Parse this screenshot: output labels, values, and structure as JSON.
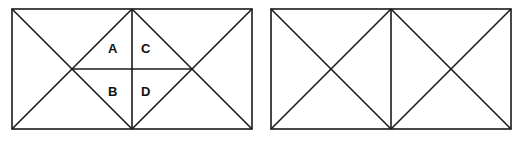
{
  "diagram": {
    "figures": [
      {
        "name": "left-rectangle",
        "description": "Rectangle split into two halves with diagonals forming a central diamond divided into four labelled regions",
        "labels": [
          "A",
          "C",
          "B",
          "D"
        ]
      },
      {
        "name": "right-rectangle",
        "description": "Rectangle split into two squares, each with both diagonals"
      }
    ],
    "labels": {
      "a": "A",
      "b": "B",
      "c": "C",
      "d": "D"
    },
    "line_color": "#1a1a1a",
    "background": "#ffffff"
  }
}
